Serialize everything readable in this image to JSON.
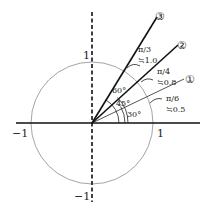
{
  "diagram": {
    "axis_labels": {
      "x_pos": "1",
      "x_neg": "−1",
      "y_pos": "1",
      "y_neg": "−1"
    },
    "rays": [
      {
        "id": "1",
        "marker": "①",
        "angle_deg": 30,
        "angle_label": "30°",
        "rad_label": "π/6",
        "approx_label": "≒0.5",
        "color": "#555555"
      },
      {
        "id": "2",
        "marker": "②",
        "angle_deg": 45,
        "angle_label": "45°",
        "rad_label": "π/4",
        "approx_label": "≒0.8",
        "color": "#111111"
      },
      {
        "id": "3",
        "marker": "③",
        "angle_deg": 60,
        "angle_label": "60°",
        "rad_label": "π/3",
        "approx_label": "≒1.0",
        "color": "#111111"
      }
    ],
    "colors": {
      "circle": "#999999",
      "axis": "#111111"
    }
  }
}
